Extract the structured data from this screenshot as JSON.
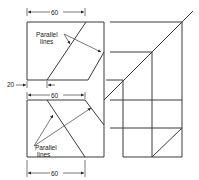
{
  "diagram": {
    "labels": {
      "top_parallel_line1": "Parallel",
      "top_parallel_line2": "lines",
      "bottom_parallel_line1": "Parallel",
      "bottom_parallel_line2": "lines"
    },
    "dimensions": {
      "top_width": "60",
      "offset": "20",
      "middle_width": "60",
      "bottom_width": "60"
    },
    "colors": {
      "line": "#3a3a3a",
      "background": "#ffffff"
    }
  }
}
